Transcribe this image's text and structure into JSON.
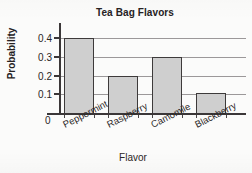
{
  "chart_data": {
    "type": "bar",
    "title": "Tea Bag Flavors",
    "xlabel": "Flavor",
    "ylabel": "Probability",
    "categories": [
      "Peppermint",
      "Raspberry",
      "Camomile",
      "Blackberry"
    ],
    "values": [
      0.4,
      0.2,
      0.3,
      0.105
    ],
    "ylim": [
      0,
      0.44
    ],
    "ytick_labels": [
      "0.1",
      "0.2",
      "0.3",
      "0.4"
    ],
    "ytick_values": [
      0.1,
      0.2,
      0.3,
      0.4
    ],
    "origin_label": "0",
    "grid": "horizontal",
    "legend": "none",
    "bar_fill_color": "#cfcfcf",
    "bar_border_color": "#3d3a3a",
    "axis_color": "#3b3738",
    "gridline_color": "#9b9899",
    "background_color": "#fbfbfa"
  }
}
